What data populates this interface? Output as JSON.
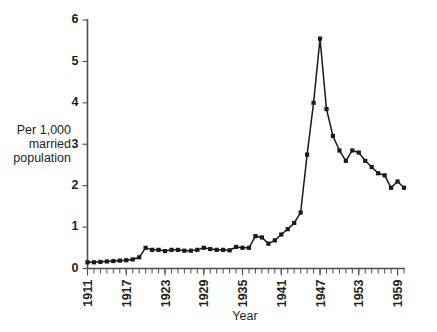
{
  "chart_data": {
    "type": "line",
    "title": "",
    "subtitle": "",
    "xlabel": "Year",
    "ylabel": "Per 1,000 married population",
    "ylabel_lines": [
      "Per 1,000",
      "married",
      "population"
    ],
    "xlim": [
      1911,
      1960
    ],
    "ylim": [
      0,
      6
    ],
    "ytick_labels": [
      "0",
      "1",
      "2",
      "3",
      "4",
      "5",
      "6"
    ],
    "ytick_values": [
      0,
      1,
      2,
      3,
      4,
      5,
      6
    ],
    "xtick_labels": [
      "1911",
      "1917",
      "1923",
      "1929",
      "1935",
      "1941",
      "1947",
      "1953",
      "1959"
    ],
    "xtick_values": [
      1911,
      1917,
      1923,
      1929,
      1935,
      1941,
      1947,
      1953,
      1959
    ],
    "xtick_minor_step": 1,
    "grid": false,
    "legend": false,
    "legend_position": "none",
    "marker": "square",
    "series": [
      {
        "name": "Divorce rate",
        "color": "#1a1a1a",
        "x": [
          1911,
          1912,
          1913,
          1914,
          1915,
          1916,
          1917,
          1918,
          1919,
          1920,
          1921,
          1922,
          1923,
          1924,
          1925,
          1926,
          1927,
          1928,
          1929,
          1930,
          1931,
          1932,
          1933,
          1934,
          1935,
          1936,
          1937,
          1938,
          1939,
          1940,
          1941,
          1942,
          1943,
          1944,
          1945,
          1946,
          1947,
          1948,
          1949,
          1950,
          1951,
          1952,
          1953,
          1954,
          1955,
          1956,
          1957,
          1958,
          1959,
          1960
        ],
        "values": [
          0.15,
          0.15,
          0.16,
          0.17,
          0.18,
          0.19,
          0.2,
          0.22,
          0.27,
          0.5,
          0.45,
          0.45,
          0.42,
          0.45,
          0.45,
          0.43,
          0.43,
          0.45,
          0.5,
          0.47,
          0.45,
          0.45,
          0.44,
          0.52,
          0.5,
          0.5,
          0.78,
          0.75,
          0.6,
          0.68,
          0.82,
          0.95,
          1.1,
          1.35,
          2.75,
          4.0,
          5.55,
          3.85,
          3.2,
          2.85,
          2.6,
          2.85,
          2.8,
          2.6,
          2.45,
          2.3,
          2.25,
          1.95,
          2.1,
          1.95
        ]
      }
    ],
    "annotations": []
  }
}
